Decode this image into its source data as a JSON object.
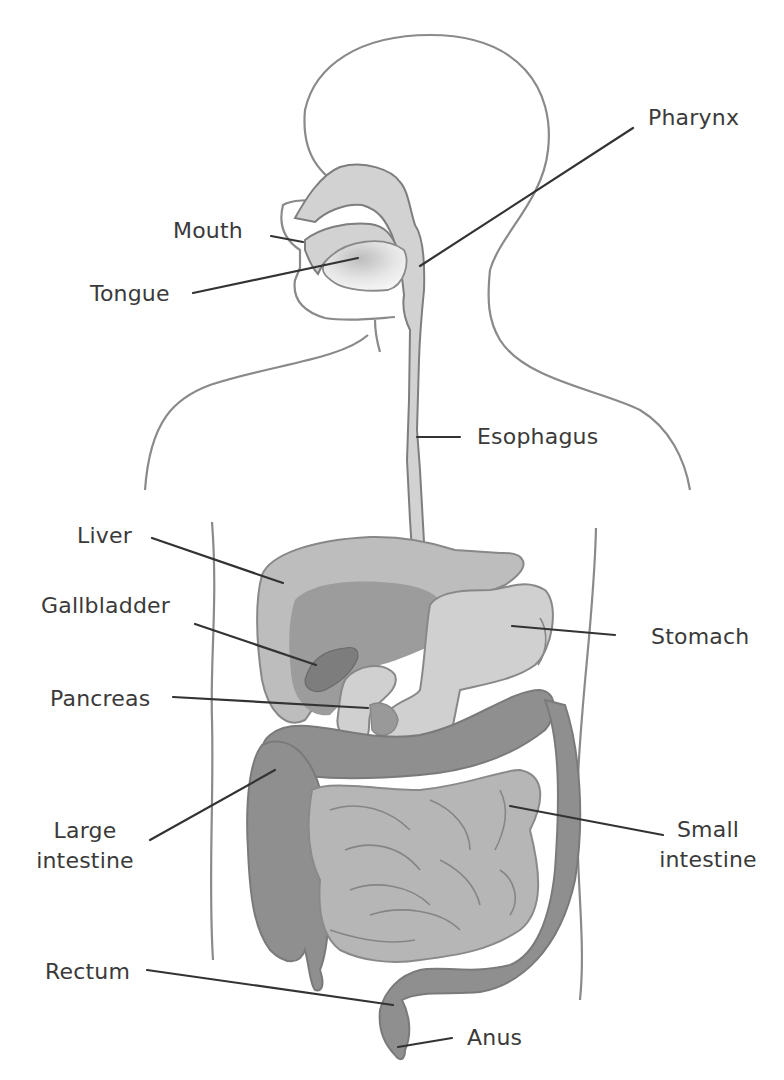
{
  "diagram": {
    "colors": {
      "outline": "#8a8a8a",
      "leader": "#333333",
      "text": "#3a3a3a",
      "light_organ": "#d2d2d2",
      "mid_organ": "#b8b8b8",
      "dark_organ": "#8f8f8f",
      "liver": "#bdbdbd",
      "liver_dark": "#9c9c9c",
      "gallbladder": "#7d7d7d",
      "background": "#ffffff"
    },
    "labels": {
      "pharynx": "Pharynx",
      "mouth": "Mouth",
      "tongue": "Tongue",
      "esophagus": "Esophagus",
      "liver": "Liver",
      "gallbladder": "Gallbladder",
      "stomach": "Stomach",
      "pancreas": "Pancreas",
      "large_intestine_1": "Large",
      "large_intestine_2": "intestine",
      "small_intestine_1": "Small",
      "small_intestine_2": "intestine",
      "rectum": "Rectum",
      "anus": "Anus"
    }
  }
}
